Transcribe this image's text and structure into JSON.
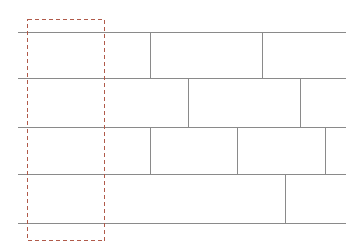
{
  "figure": {
    "type": "masonry-coursing-diagram",
    "title": "",
    "background_color": "#ffffff",
    "canvas": {
      "width": 360,
      "height": 246
    }
  },
  "styles": {
    "course_line_color": "#8a8a8a",
    "head_joint_color": "#8a8a8a",
    "module_outline_color": "#b05a4a",
    "course_line_width": 1,
    "head_joint_width": 1,
    "module_outline_width": 1,
    "module_dash_pattern": "4 3"
  },
  "chart_data": {
    "type": "diagram",
    "wall_extent": {
      "x_left": 17,
      "x_right": 345,
      "y_top": 32,
      "y_bottom": 223
    },
    "bed_joints": [
      {
        "name": "bed-joint-1",
        "y": 32,
        "x_start": 17,
        "x_end": 345
      },
      {
        "name": "bed-joint-2",
        "y": 78,
        "x_start": 17,
        "x_end": 345
      },
      {
        "name": "bed-joint-3",
        "y": 127,
        "x_start": 17,
        "x_end": 345
      },
      {
        "name": "bed-joint-4",
        "y": 174,
        "x_start": 17,
        "x_end": 345
      },
      {
        "name": "bed-joint-5",
        "y": 223,
        "x_start": 17,
        "x_end": 345
      }
    ],
    "courses": [
      {
        "name": "course-1",
        "y_top": 32,
        "y_bottom": 78,
        "head_joints": [
          150,
          262
        ]
      },
      {
        "name": "course-2",
        "y_top": 78,
        "y_bottom": 127,
        "head_joints": [
          188,
          300
        ]
      },
      {
        "name": "course-3",
        "y_top": 127,
        "y_bottom": 174,
        "head_joints": [
          150,
          237,
          325
        ]
      },
      {
        "name": "course-4",
        "y_top": 174,
        "y_bottom": 223,
        "head_joints": [
          285
        ]
      }
    ],
    "repeat_module": {
      "label": "",
      "x": 27,
      "y": 19,
      "width": 77,
      "height": 221,
      "x_left": 27,
      "x_right": 104,
      "y_top": 19,
      "y_bottom": 240
    }
  }
}
